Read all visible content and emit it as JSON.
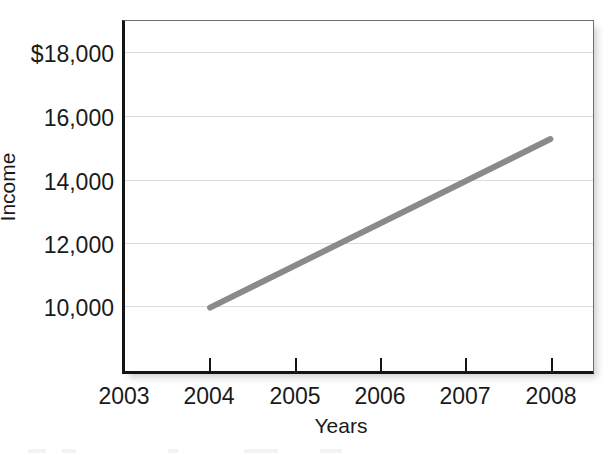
{
  "chart_data": {
    "type": "line",
    "title": "",
    "xlabel": "Years",
    "ylabel": "Income",
    "x": [
      2004,
      2005,
      2006,
      2007,
      2008
    ],
    "series": [
      {
        "name": "Income",
        "values": [
          10500,
          11770,
          13050,
          14300,
          15560
        ],
        "color": "#8a8a8a"
      }
    ],
    "x_tick_labels": [
      "2003",
      "2004",
      "2005",
      "2006",
      "2007",
      "2008"
    ],
    "y_tick_labels": [
      "10,000",
      "12,000",
      "14,000",
      "16,000",
      "$18,000"
    ],
    "y_tick_values": [
      10000,
      12000,
      14000,
      16000,
      18000
    ],
    "xlim": [
      2003,
      2008.5
    ],
    "ylim": [
      8600,
      19100
    ],
    "grid": "horizontal",
    "legend": "none"
  },
  "axes": {
    "y_title": "Income",
    "x_title": "Years"
  },
  "ticks": {
    "y": [
      {
        "label": "$18,000",
        "value": 18000
      },
      {
        "label": "16,000",
        "value": 16000
      },
      {
        "label": "14,000",
        "value": 14000
      },
      {
        "label": "12,000",
        "value": 12000
      },
      {
        "label": "10,000",
        "value": 10000
      }
    ],
    "x": [
      {
        "label": "2003"
      },
      {
        "label": "2004"
      },
      {
        "label": "2005"
      },
      {
        "label": "2006"
      },
      {
        "label": "2007"
      },
      {
        "label": "2008"
      }
    ]
  },
  "colors": {
    "series_line": "#8a8a8a",
    "axis": "#141414",
    "grid": "#dcdcdc",
    "frame": "#6e6e6e",
    "text": "#1a1a1a",
    "background": "#ffffff"
  }
}
